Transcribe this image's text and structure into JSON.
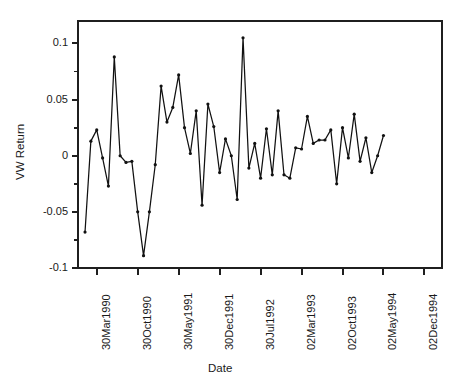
{
  "chart_data": {
    "type": "line",
    "title": "",
    "xlabel": "Date",
    "ylabel": "VW Return",
    "grid": false,
    "legend": "none",
    "ylim": [
      -0.1,
      0.12
    ],
    "yticks": [
      0.1,
      0.05,
      0,
      -0.05,
      -0.1
    ],
    "ytick_labels": [
      "0.1",
      "0.05",
      "0",
      "-0.05",
      "-0.1"
    ],
    "yminor_ticks": [
      0.075,
      0.025,
      -0.025,
      -0.075
    ],
    "xtick_labels": [
      "30Mar1990",
      "30Oct1990",
      "30May1991",
      "30Dec1991",
      "30Jul1992",
      "02Mar1993",
      "02Oct1993",
      "02May1994",
      "02Dec1994"
    ],
    "xtick_positions": [
      2,
      9,
      16,
      23,
      30,
      37,
      44,
      51,
      58
    ],
    "xlim": [
      -1.2,
      61
    ],
    "series": [
      {
        "name": "VW Return",
        "marker": "filled-circle",
        "color": "#111111",
        "x": [
          0,
          1,
          2,
          3,
          4,
          5,
          6,
          7,
          8,
          9,
          10,
          11,
          12,
          13,
          14,
          15,
          16,
          17,
          18,
          19,
          20,
          21,
          22,
          23,
          24,
          25,
          26,
          27,
          28,
          29,
          30,
          31,
          32,
          33,
          34,
          35,
          36,
          37,
          38,
          39,
          40,
          41,
          42,
          43,
          44,
          45,
          46,
          47,
          48,
          49,
          50,
          51
        ],
        "values": [
          -0.068,
          0.013,
          0.023,
          -0.002,
          -0.027,
          0.088,
          0.0,
          -0.006,
          -0.005,
          -0.05,
          -0.089,
          -0.05,
          -0.008,
          0.062,
          0.03,
          0.043,
          0.072,
          0.025,
          0.002,
          0.04,
          -0.044,
          0.046,
          0.026,
          -0.015,
          0.015,
          0.0,
          -0.039,
          0.105,
          -0.011,
          0.011,
          -0.02,
          0.024,
          -0.017,
          0.04,
          -0.017,
          -0.02,
          0.007,
          0.006,
          0.035,
          0.011,
          0.014,
          0.014,
          0.023,
          -0.025,
          0.025,
          -0.002,
          0.037,
          -0.005,
          0.016,
          -0.015,
          0.0,
          0.018
        ]
      }
    ]
  },
  "axis": {
    "y_label_text": "VW Return",
    "x_label_text": "Date"
  }
}
